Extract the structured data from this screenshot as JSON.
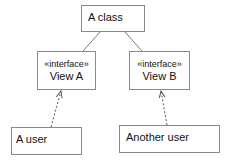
{
  "diagram": {
    "type": "UML class diagram",
    "nodes": [
      {
        "id": "a_class",
        "label": "A class"
      },
      {
        "id": "view_a",
        "stereotype": "«interface»",
        "label": "View A"
      },
      {
        "id": "view_b",
        "stereotype": "«interface»",
        "label": "View B"
      },
      {
        "id": "a_user",
        "label": "A user"
      },
      {
        "id": "another_user",
        "label": "Another user"
      }
    ],
    "edges": [
      {
        "from": "a_class",
        "to": "view_a",
        "style": "solid"
      },
      {
        "from": "a_class",
        "to": "view_b",
        "style": "solid"
      },
      {
        "from": "a_user",
        "to": "view_a",
        "style": "dashed",
        "arrow": "open"
      },
      {
        "from": "another_user",
        "to": "view_b",
        "style": "dashed",
        "arrow": "open"
      }
    ]
  },
  "colors": {
    "border": "#8a8a8a",
    "line": "#777777",
    "text": "#111111"
  }
}
